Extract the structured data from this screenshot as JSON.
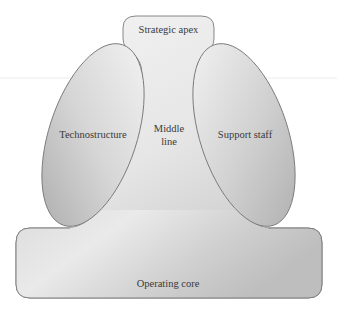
{
  "diagram": {
    "type": "organizational-structure",
    "parts": {
      "strategic_apex": "Strategic apex",
      "technostructure": "Technostructure",
      "middle_line_1": "Middle",
      "middle_line_2": "line",
      "support_staff": "Support staff",
      "operating_core": "Operating core"
    },
    "colors": {
      "background": "#ffffff",
      "shape_stroke": "#7a7a7a",
      "shape_fill_light": "#f2f2f2",
      "shape_fill_dark": "#b4b4b4",
      "text": "#3a3a3a"
    }
  }
}
